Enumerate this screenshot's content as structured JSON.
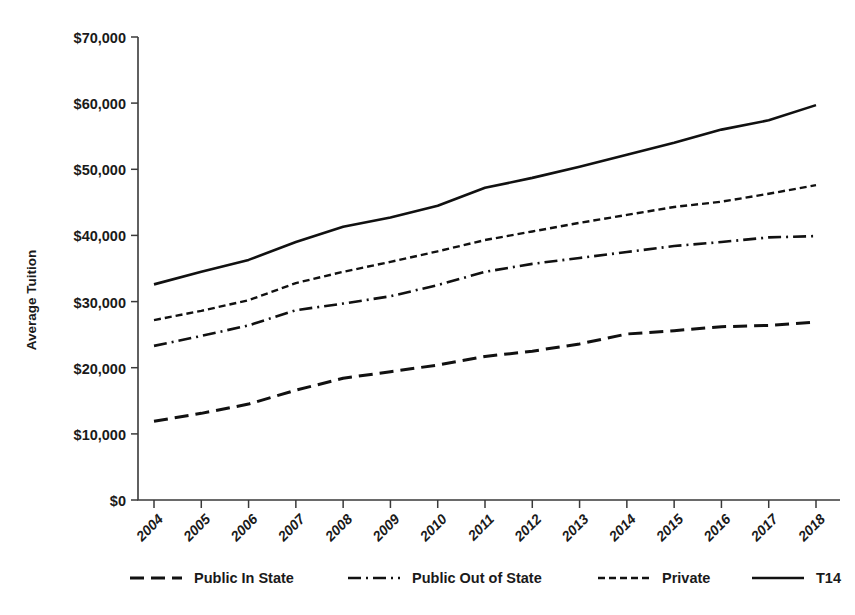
{
  "chart_data": {
    "type": "line",
    "title": "",
    "xlabel": "",
    "ylabel": "Average Tuition",
    "x": [
      2004,
      2005,
      2006,
      2007,
      2008,
      2009,
      2010,
      2011,
      2012,
      2013,
      2014,
      2015,
      2016,
      2017,
      2018
    ],
    "categories": [
      "2004",
      "2005",
      "2006",
      "2007",
      "2008",
      "2009",
      "2010",
      "2011",
      "2012",
      "2013",
      "2014",
      "2015",
      "2016",
      "2017",
      "2018"
    ],
    "ylim": [
      0,
      70000
    ],
    "xlim": [
      2004,
      2018
    ],
    "yticks": [
      0,
      10000,
      20000,
      30000,
      40000,
      50000,
      60000,
      70000
    ],
    "ytick_labels": [
      "$0",
      "$10,000",
      "$20,000",
      "$30,000",
      "$40,000",
      "$50,000",
      "$60,000",
      "$70,000"
    ],
    "grid": false,
    "legend_position": "bottom",
    "series": [
      {
        "name": "Public In State",
        "style": "long-dash",
        "color": "#111111",
        "values": [
          11900,
          13100,
          14500,
          16600,
          18400,
          19400,
          20400,
          21700,
          22500,
          23600,
          25100,
          25600,
          26200,
          26400,
          26900
        ]
      },
      {
        "name": "Public Out of State",
        "style": "dash-dot",
        "color": "#111111",
        "values": [
          23300,
          24800,
          26400,
          28700,
          29700,
          30800,
          32500,
          34500,
          35700,
          36600,
          37500,
          38400,
          39000,
          39700,
          39900
        ]
      },
      {
        "name": "Private",
        "style": "short-dash",
        "color": "#111111",
        "values": [
          27200,
          28600,
          30200,
          32800,
          34500,
          36000,
          37600,
          39300,
          40600,
          41900,
          43100,
          44300,
          45100,
          46300,
          47600
        ]
      },
      {
        "name": "T14",
        "style": "solid",
        "color": "#111111",
        "values": [
          32600,
          34500,
          36300,
          39000,
          41300,
          42700,
          44500,
          47200,
          48700,
          50400,
          52200,
          54000,
          56000,
          57400,
          59700
        ]
      }
    ]
  },
  "axes": {
    "y_label": "Average Tuition",
    "y_ticks": [
      "$70,000",
      "$60,000",
      "$50,000",
      "$40,000",
      "$30,000",
      "$20,000",
      "$10,000",
      "$0"
    ],
    "x_ticks": [
      "2004",
      "2005",
      "2006",
      "2007",
      "2008",
      "2009",
      "2010",
      "2011",
      "2012",
      "2013",
      "2014",
      "2015",
      "2016",
      "2017",
      "2018"
    ]
  },
  "legend": {
    "items": [
      {
        "label": "Public In State",
        "style": "long-dash"
      },
      {
        "label": "Public Out of State",
        "style": "dash-dot"
      },
      {
        "label": "Private",
        "style": "short-dash"
      },
      {
        "label": "T14",
        "style": "solid"
      }
    ]
  }
}
